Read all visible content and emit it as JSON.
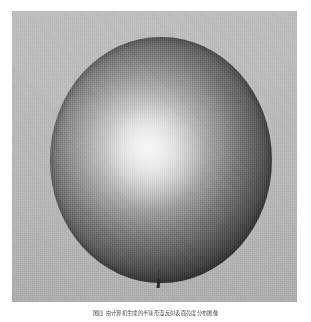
{
  "document": {
    "kind": "scanned-figure-plate",
    "background_color": "#ffffff"
  },
  "figure": {
    "name": "shaded-sphere-plate",
    "plate_background_color": "#b5b5b5",
    "label_mark": "",
    "sphere": {
      "description": "diffusely shaded sphere with bright highlight toward upper-left of center",
      "highlight_color": "#f2f2f2",
      "terminator_color": "#1e1e1e",
      "center_x": 161,
      "center_y": 160,
      "radius_x": 111,
      "radius_y": 123,
      "highlight_x_pct": 43,
      "highlight_y_pct": 44
    }
  },
  "caption": {
    "text": "图四 由计算机生成的半球形漫反射表面亮度分布图像"
  }
}
